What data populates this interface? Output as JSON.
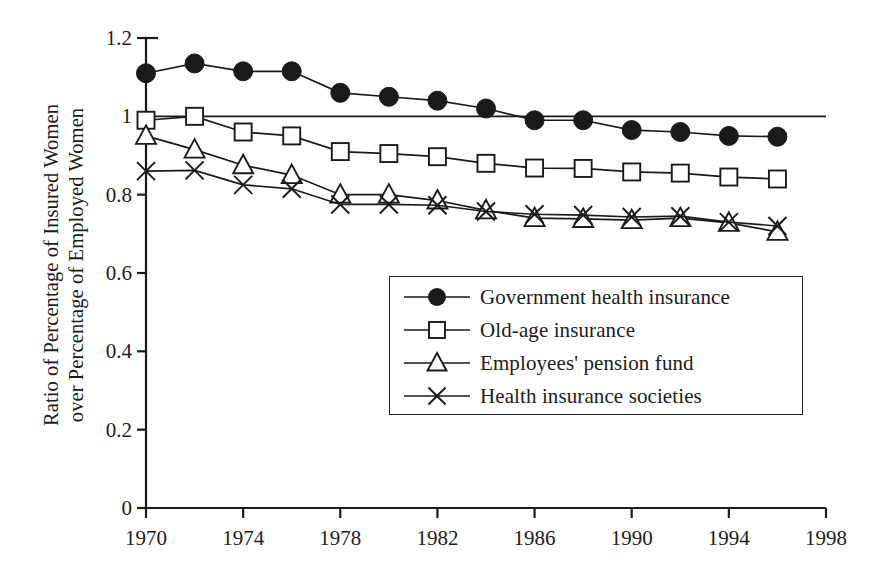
{
  "chart_data": {
    "type": "line",
    "title": "",
    "subtitle": "",
    "xlabel": "",
    "ylabel": "Ratio of Percentage of Insured Women over Percentage of Employed Women",
    "ylabel_lines": [
      "Ratio of Percentage of Insured Women",
      "over Percentage of Employed Women"
    ],
    "xlim": [
      1970,
      1998
    ],
    "ylim": [
      0,
      1.2
    ],
    "x_ticks": [
      1970,
      1974,
      1978,
      1982,
      1986,
      1990,
      1994,
      1998
    ],
    "x_tick_labels": [
      "1970",
      "1974",
      "1978",
      "1982",
      "1986",
      "1990",
      "1994",
      "1998"
    ],
    "x_minor_ticks": [
      1972,
      1976,
      1980,
      1984,
      1988,
      1992,
      1996
    ],
    "y_ticks": [
      0,
      0.2,
      0.4,
      0.6,
      0.8,
      1,
      1.2
    ],
    "y_tick_labels": [
      "0",
      "0.2",
      "0.4",
      "0.6",
      "0.8",
      "1",
      "1.2"
    ],
    "grid": false,
    "legend_position": "inside-lower-right",
    "reference_line": {
      "y": 1.0,
      "x_start": 1970,
      "x_end": 1998
    },
    "x": [
      1970,
      1972,
      1974,
      1976,
      1978,
      1980,
      1982,
      1984,
      1986,
      1988,
      1990,
      1992,
      1994,
      1996
    ],
    "series": [
      {
        "name": "Government health insurance",
        "marker": "filled-circle",
        "color": "#1a1a1a",
        "values": [
          1.11,
          1.135,
          1.115,
          1.115,
          1.06,
          1.05,
          1.04,
          1.02,
          0.99,
          0.99,
          0.965,
          0.96,
          0.95,
          0.948
        ]
      },
      {
        "name": "Old-age insurance",
        "marker": "open-square",
        "color": "#1a1a1a",
        "values": [
          0.99,
          1.0,
          0.96,
          0.95,
          0.91,
          0.905,
          0.897,
          0.88,
          0.868,
          0.867,
          0.858,
          0.855,
          0.845,
          0.84
        ]
      },
      {
        "name": "Employees' pension fund",
        "marker": "open-triangle",
        "color": "#1a1a1a",
        "values": [
          0.95,
          0.915,
          0.875,
          0.85,
          0.8,
          0.8,
          0.785,
          0.76,
          0.74,
          0.738,
          0.735,
          0.74,
          0.728,
          0.705
        ]
      },
      {
        "name": "Health insurance societies",
        "marker": "cross-x",
        "color": "#1a1a1a",
        "values": [
          0.86,
          0.862,
          0.825,
          0.815,
          0.775,
          0.775,
          0.773,
          0.757,
          0.75,
          0.748,
          0.743,
          0.745,
          0.73,
          0.72
        ]
      }
    ]
  },
  "legend": {
    "items": [
      {
        "label": "Government health insurance",
        "marker": "filled-circle"
      },
      {
        "label": "Old-age insurance",
        "marker": "open-square"
      },
      {
        "label": "Employees' pension fund",
        "marker": "open-triangle"
      },
      {
        "label": "Health insurance societies",
        "marker": "cross-x"
      }
    ]
  }
}
